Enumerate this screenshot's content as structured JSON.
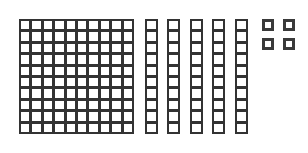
{
  "diagram": {
    "title": "",
    "type": "base-ten-blocks",
    "line_color": "#333333",
    "background": "#ffffff",
    "represented_value": 154,
    "hundreds": {
      "count": 1,
      "rows": 10,
      "cols": 10,
      "x": 19,
      "y": 19,
      "width": 115,
      "height": 115
    },
    "tens": {
      "count": 5,
      "cells_per_rod": 10,
      "rod_width": 13,
      "rod_height": 115,
      "y": 19,
      "x_positions": [
        145,
        167,
        190,
        212,
        235
      ]
    },
    "ones": {
      "count": 4,
      "size": 12,
      "positions": [
        {
          "x": 262,
          "y": 19
        },
        {
          "x": 283,
          "y": 19
        },
        {
          "x": 262,
          "y": 38
        },
        {
          "x": 283,
          "y": 38
        }
      ]
    }
  }
}
